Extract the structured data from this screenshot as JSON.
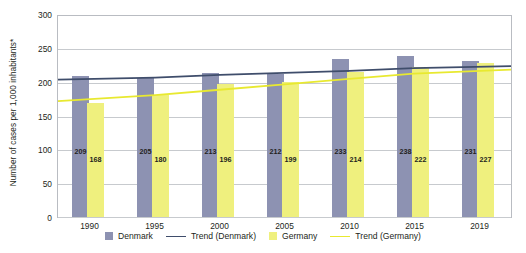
{
  "chart_data": {
    "type": "bar",
    "title": "",
    "subtitle": "",
    "xlabel": "",
    "ylabel": "Number of cases per 1,000 inhabitants*",
    "categories": [
      "1990",
      "1995",
      "2000",
      "2005",
      "2010",
      "2015",
      "2019"
    ],
    "series": [
      {
        "name": "Denmark",
        "type": "bar",
        "color": "#8d92b2",
        "values": [
          209,
          205,
          213,
          212,
          233,
          238,
          231
        ]
      },
      {
        "name": "Germany",
        "type": "bar",
        "color": "#eff07e",
        "values": [
          168,
          180,
          196,
          199,
          214,
          222,
          227
        ]
      },
      {
        "name": "Trend (Denmark)",
        "type": "line",
        "color": "#3f4d6b",
        "values": [
          204,
          207,
          211,
          214,
          217,
          221,
          224
        ]
      },
      {
        "name": "Trend (Germany)",
        "type": "line",
        "color": "#e8e930",
        "values": [
          172,
          181,
          189,
          197,
          205,
          213,
          219
        ]
      }
    ],
    "ylim": [
      0,
      300
    ],
    "yticks": [
      0,
      50,
      100,
      150,
      200,
      250,
      300
    ],
    "ytick_labels": [
      "0",
      "50",
      "100",
      "150",
      "200",
      "250",
      "300"
    ],
    "grid": true,
    "legend_position": "bottom",
    "legend": [
      "Denmark",
      "Trend (Denmark)",
      "Germany",
      "Trend (Germany)"
    ]
  },
  "legend": {
    "items": [
      {
        "label": "Denmark",
        "marker": "square-swatch",
        "color": "#8d92b2"
      },
      {
        "label": "Trend (Denmark)",
        "marker": "line-swatch",
        "color": "#3f4d6b"
      },
      {
        "label": "Germany",
        "marker": "square-swatch",
        "color": "#eff07e"
      },
      {
        "label": "Trend (Germany)",
        "marker": "line-swatch",
        "color": "#e8e930"
      }
    ]
  }
}
